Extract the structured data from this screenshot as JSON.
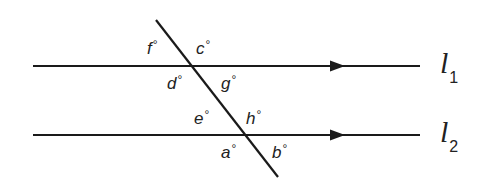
{
  "diagram": {
    "lines": [
      {
        "id": "l1",
        "name": "l",
        "subscript": "1",
        "y": 66,
        "x1": 33,
        "x2": 420,
        "arrow_x": 340
      },
      {
        "id": "l2",
        "name": "l",
        "subscript": "2",
        "y": 135,
        "x1": 33,
        "x2": 420,
        "arrow_x": 340
      }
    ],
    "transversal": {
      "x1": 156,
      "y1": 20,
      "x2": 278,
      "y2": 177
    },
    "degree_symbol": "°",
    "angles": {
      "f": {
        "label": "f",
        "x": 147,
        "y": 40
      },
      "c": {
        "label": "c",
        "x": 197,
        "y": 40
      },
      "d": {
        "label": "d",
        "x": 167,
        "y": 74
      },
      "g": {
        "label": "g",
        "x": 221,
        "y": 74
      },
      "e": {
        "label": "e",
        "x": 195,
        "y": 110
      },
      "h": {
        "label": "h",
        "x": 246,
        "y": 110
      },
      "a": {
        "label": "a",
        "x": 221,
        "y": 143
      },
      "b": {
        "label": "b",
        "x": 272,
        "y": 143
      }
    },
    "colors": {
      "stroke": "#1a1a1a",
      "text": "#222222",
      "background": "#ffffff"
    }
  }
}
